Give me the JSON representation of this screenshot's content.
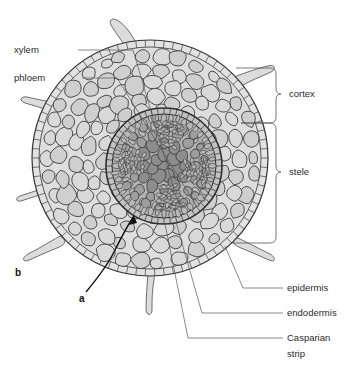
{
  "figure": {
    "kind": "root-cross-section-diagram",
    "background_color": "#ffffff"
  },
  "labels": {
    "xylem": "xylem",
    "phloem": "phloem",
    "cortex": "cortex",
    "stele": "stele",
    "epidermis": "epidermis",
    "endodermis": "endodermis",
    "casparian_line1": "Casparian",
    "casparian_line2": "strip",
    "marker_a": "a",
    "marker_b": "b"
  },
  "colors": {
    "text": "#2b2b2b",
    "marker_text": "#111111",
    "leader_line": "#55565a",
    "cell_outline": "#3a3a3a",
    "cortex_cell_fill": "#d9d9d9",
    "cortex_cell_fill_alt": "#cfcfcf",
    "stele_outer_fill": "#b4b4b4",
    "stele_inner_fill": "#9e9e9e",
    "xylem_cell_fill": "#8d8d8d",
    "phloem_cell_fill": "#b9b9b9",
    "epidermis_fill": "#e2e2e2",
    "root_hair_fill": "#dcdcdc",
    "pointer": "#111111"
  },
  "geometry": {
    "image_width": 357,
    "image_height": 376,
    "root_center_x": 150,
    "root_center_y": 158,
    "root_radius": 118,
    "stele_center_x": 164,
    "stele_center_y": 166,
    "stele_radius": 58,
    "vascular_radius": 46
  },
  "structures": [
    {
      "name": "epidermis",
      "description": "single outer cell layer bearing root hairs"
    },
    {
      "name": "root-hairs",
      "count": 7,
      "description": "tubular outgrowths of epidermal cells"
    },
    {
      "name": "cortex",
      "description": "broad zone of large rounded parenchyma cells"
    },
    {
      "name": "endodermis",
      "description": "innermost cortex layer surrounding the stele"
    },
    {
      "name": "casparian-strip",
      "description": "suberised band in endodermal radial walls"
    },
    {
      "name": "stele",
      "description": "central vascular cylinder"
    },
    {
      "name": "xylem",
      "description": "water conducting tissue at the stele centre"
    },
    {
      "name": "phloem",
      "description": "food conducting tissue between xylem arms"
    }
  ]
}
